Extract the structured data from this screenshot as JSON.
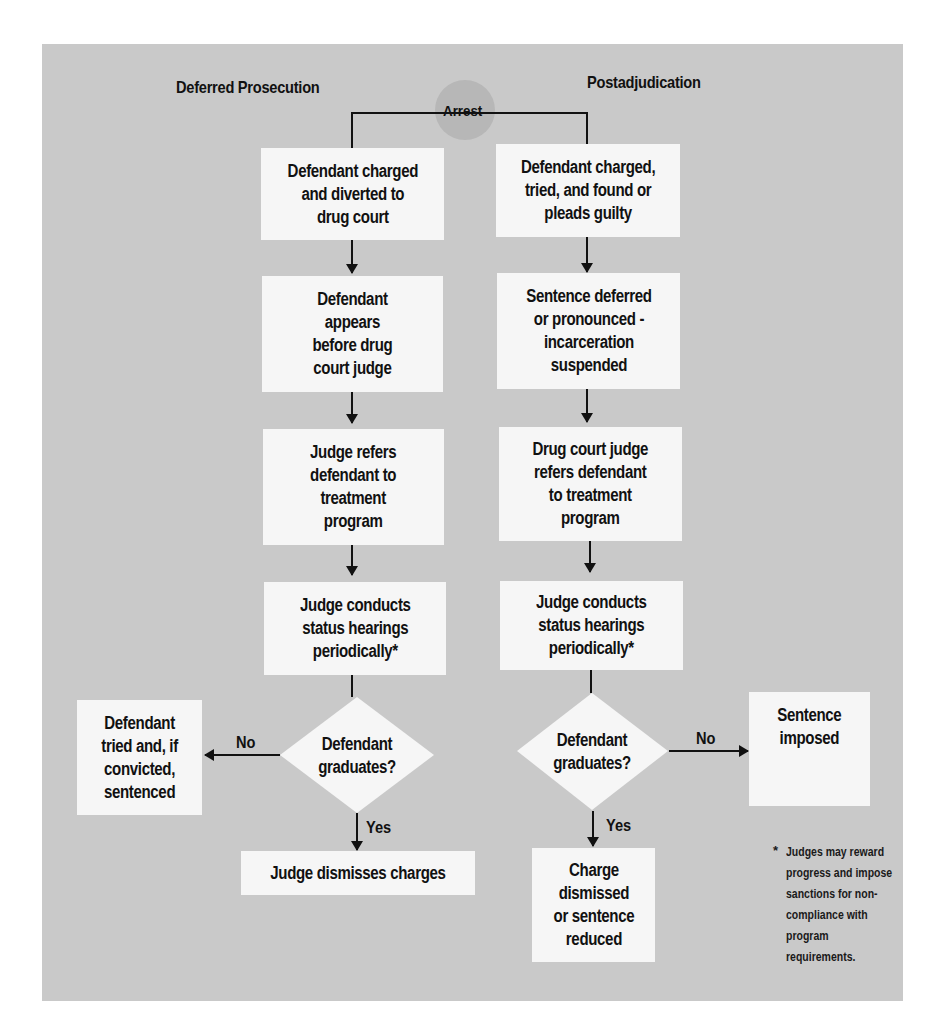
{
  "diagram": {
    "type": "flowchart",
    "start": {
      "label": "Arrest"
    },
    "columns": [
      {
        "title": "Deferred Prosecution",
        "steps": [
          "Defendant charged\nand diverted to\ndrug court",
          "Defendant\nappears\nbefore drug\ncourt judge",
          "Judge refers\ndefendant to\ntreatment\nprogram",
          "Judge conducts\nstatus hearings\nperiodically*"
        ],
        "decision": "Defendant\ngraduates?",
        "no_label": "No",
        "no_outcome": "Defendant\ntried and, if\nconvicted,\nsentenced",
        "yes_label": "Yes",
        "yes_outcome": "Judge dismisses charges"
      },
      {
        "title": "Postadjudication",
        "steps": [
          "Defendant charged,\ntried, and found or\npleads guilty",
          "Sentence deferred\nor pronounced -\nincarceration\nsuspended",
          "Drug court judge\nrefers defendant\nto treatment\nprogram",
          "Judge conducts\nstatus hearings\nperiodically*"
        ],
        "decision": "Defendant\ngraduates?",
        "no_label": "No",
        "no_outcome": "Sentence\nimposed",
        "yes_label": "Yes",
        "yes_outcome": "Charge\ndismissed\nor sentence\nreduced"
      }
    ],
    "footnote": {
      "marker": "*",
      "text": "Judges may reward\nprogress and impose\nsanctions for non-\ncompliance with\nprogram requirements."
    },
    "colors": {
      "panel": "#c9c9c9",
      "box": "#f6f6f6",
      "line": "#111111",
      "arrest_circle": "#b7b7b7"
    }
  }
}
